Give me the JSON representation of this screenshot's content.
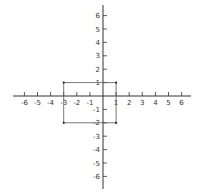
{
  "diagram": {
    "type": "coordinate-plane",
    "x_axis": {
      "min": -6,
      "max": 6,
      "ticks": [
        -6,
        -5,
        -4,
        -3,
        -2,
        -1,
        1,
        2,
        3,
        4,
        5,
        6
      ]
    },
    "y_axis": {
      "min": -6,
      "max": 6,
      "ticks": [
        6,
        5,
        4,
        3,
        2,
        1,
        -1,
        -2,
        -3,
        -4,
        -5,
        -6
      ]
    },
    "rectangle": {
      "vertices": [
        [
          -3,
          1
        ],
        [
          1,
          1
        ],
        [
          1,
          -2
        ],
        [
          -3,
          -2
        ]
      ]
    },
    "colors": {
      "axis": "#333333",
      "shape": "#555555",
      "background": "#ffffff"
    }
  },
  "labels": {
    "x": [
      "-6",
      "-5",
      "-4",
      "-3",
      "-2",
      "-1",
      "1",
      "2",
      "3",
      "4",
      "5",
      "6"
    ],
    "y": [
      "6",
      "5",
      "4",
      "3",
      "2",
      "1",
      "-1",
      "-2",
      "-3",
      "-4",
      "-5",
      "-6"
    ]
  }
}
